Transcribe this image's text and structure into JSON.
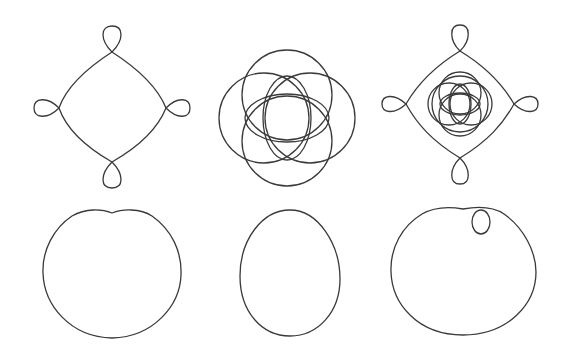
{
  "figure": {
    "stroke_color": "#3a3a3a",
    "background_color": "#ffffff",
    "layout": "2 rows x 3 columns of line-drawn closed curves, no text",
    "panels": [
      {
        "id": "top-left",
        "shape": "looped-diamond",
        "description": "Diamond with a small teardrop loop at each of 4 vertices"
      },
      {
        "id": "top-middle",
        "shape": "ring-rosette",
        "description": "Overlapping circles forming a rosette"
      },
      {
        "id": "top-right",
        "shape": "looped-diamond-with-rosette",
        "description": "Looped diamond enclosing a small rosette"
      },
      {
        "id": "bottom-left",
        "shape": "dimpled-round",
        "description": "Near-circle with a shallow dip at the top"
      },
      {
        "id": "bottom-middle",
        "shape": "egg",
        "description": "Vertical egg / ellipse"
      },
      {
        "id": "bottom-right",
        "shape": "dimpled-round-with-inner-oval",
        "description": "Dimpled near-circle with a small oval inside near upper right"
      }
    ]
  }
}
